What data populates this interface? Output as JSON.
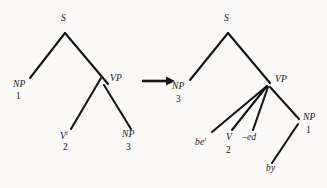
{
  "figure": {
    "caption": "",
    "background_color": "#fbfaf8",
    "ink_color": "#151515"
  },
  "transform_arrow": {
    "icon": "right-arrow-icon",
    "label": "→"
  },
  "left_tree": {
    "name": "source-tree",
    "root": {
      "label": "S"
    },
    "nodes": [
      {
        "id": "s",
        "label": "S",
        "index": ""
      },
      {
        "id": "np1",
        "label": "NP",
        "index": "1"
      },
      {
        "id": "vp",
        "label": "VP",
        "index": ""
      },
      {
        "id": "vt",
        "label": "V",
        "superscript": "t",
        "index": "2"
      },
      {
        "id": "np3",
        "label": "NP",
        "index": "3"
      }
    ],
    "labels": {
      "s": "S",
      "np_subject": "NP",
      "np_subject_index": "1",
      "vp": "VP",
      "verb": "V",
      "verb_superscript": "t",
      "verb_index": "2",
      "np_object": "NP",
      "np_object_index": "3"
    }
  },
  "right_tree": {
    "name": "target-tree",
    "root": {
      "label": "S"
    },
    "nodes": [
      {
        "id": "s",
        "label": "S",
        "index": ""
      },
      {
        "id": "np3",
        "label": "NP",
        "index": "3"
      },
      {
        "id": "vp",
        "label": "VP",
        "index": ""
      },
      {
        "id": "be",
        "label": "be",
        "superscript": "t",
        "index": ""
      },
      {
        "id": "v2",
        "label": "V",
        "index": "2"
      },
      {
        "id": "ed",
        "label": "–ed",
        "index": ""
      },
      {
        "id": "np1",
        "label": "NP",
        "index": "1"
      },
      {
        "id": "by",
        "label": "by",
        "index": ""
      }
    ],
    "labels": {
      "s": "S",
      "np_subject": "NP",
      "np_subject_index": "3",
      "vp": "VP",
      "aux_be": "be",
      "aux_be_superscript": "t",
      "verb": "V",
      "verb_index": "2",
      "suffix_ed": "–ed",
      "np_agent": "NP",
      "np_agent_index": "1",
      "preposition": "by"
    }
  }
}
